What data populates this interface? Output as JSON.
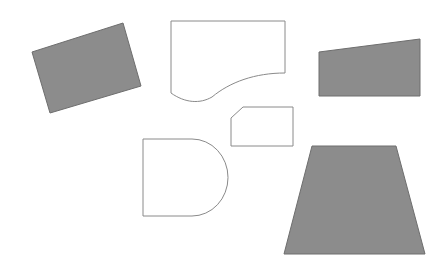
{
  "canvas": {
    "width": 438,
    "height": 264,
    "background": "#ffffff"
  },
  "colors": {
    "fill_gray": "#8c8c8c",
    "fill_stroke": "#6e6e6e",
    "outline_stroke": "#8a8a8a"
  },
  "shapes": [
    {
      "id": "rotated-rectangle",
      "style": "filled",
      "d": "M32,52 L123,23 L141,86 L50,113 Z"
    },
    {
      "id": "document-shape",
      "style": "outline",
      "d": "M171,21 L285,21 L285,73 C255,73 230,82 212,97 C200,104 185,103 171,93 Z"
    },
    {
      "id": "right-trapezoid",
      "style": "filled",
      "d": "M319,52 L420,39 L420,96 L319,96 Z"
    },
    {
      "id": "snipped-rectangle",
      "style": "outline",
      "d": "M231,118 L243,107 L293,107 L293,146 L231,146 Z"
    },
    {
      "id": "d-shape",
      "style": "outline",
      "d": "M143,139 L192,139 A36,38.5 0 0 1 192,216 L143,216 Z"
    },
    {
      "id": "trapezoid",
      "style": "filled",
      "d": "M312,146 L396,146 L425,254 L284,254 Z"
    }
  ]
}
